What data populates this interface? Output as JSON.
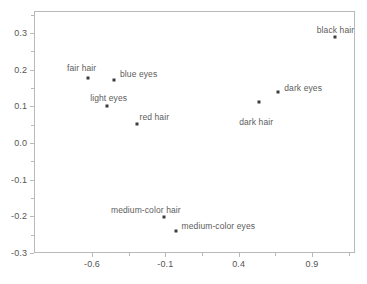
{
  "chart_data": {
    "type": "scatter",
    "title": "",
    "subtitle": "",
    "xlabel": "",
    "ylabel": "",
    "grid": false,
    "legend": false,
    "xlim": [
      -0.82,
      1.37
    ],
    "ylim": [
      -0.3,
      0.36
    ],
    "xticks": [
      -0.6,
      -0.1,
      0.4,
      0.9
    ],
    "xtick_labels": [
      "-0.6",
      "-0.1",
      "0.4",
      "0.9"
    ],
    "xminor_ticks": [
      -0.35,
      0.15,
      0.65,
      1.15
    ],
    "yticks": [
      -0.3,
      -0.2,
      -0.1,
      0.0,
      0.1,
      0.2,
      0.3
    ],
    "ytick_labels": [
      "-0.3",
      "-0.2",
      "-0.1",
      "0.0",
      "0.1",
      "0.2",
      "0.3"
    ],
    "yminor_ticks": [
      -0.25,
      -0.15,
      -0.05,
      0.05,
      0.15,
      0.25,
      0.35
    ],
    "marker_color": "#3c3c3c",
    "axis_color": "#b9b9b9",
    "label_color": "#5c5c5c",
    "points": [
      {
        "label": "fair hair",
        "x": -0.63,
        "y": 0.177,
        "label_dx": -6,
        "label_dy": -15,
        "align": "center"
      },
      {
        "label": "blue eyes",
        "x": -0.45,
        "y": 0.171,
        "label_dx": 6,
        "label_dy": -11,
        "align": "start"
      },
      {
        "label": "light eyes",
        "x": -0.5,
        "y": 0.101,
        "label_dx": 2,
        "label_dy": -13,
        "align": "center"
      },
      {
        "label": "red hair",
        "x": -0.29,
        "y": 0.052,
        "label_dx": 2,
        "label_dy": -12,
        "align": "start"
      },
      {
        "label": "medium-color hair",
        "x": -0.11,
        "y": -0.202,
        "label_dx": -18,
        "label_dy": -12,
        "align": "center"
      },
      {
        "label": "medium-color eyes",
        "x": -0.03,
        "y": -0.24,
        "label_dx": 6,
        "label_dy": -10,
        "align": "start"
      },
      {
        "label": "dark hair",
        "x": 0.54,
        "y": 0.112,
        "label_dx": -3,
        "label_dy": 15,
        "align": "center"
      },
      {
        "label": "dark eyes",
        "x": 0.67,
        "y": 0.139,
        "label_dx": 6,
        "label_dy": -9,
        "align": "start"
      },
      {
        "label": "black hair",
        "x": 1.06,
        "y": 0.289,
        "label_dx": 0,
        "label_dy": -12,
        "align": "center"
      }
    ]
  }
}
